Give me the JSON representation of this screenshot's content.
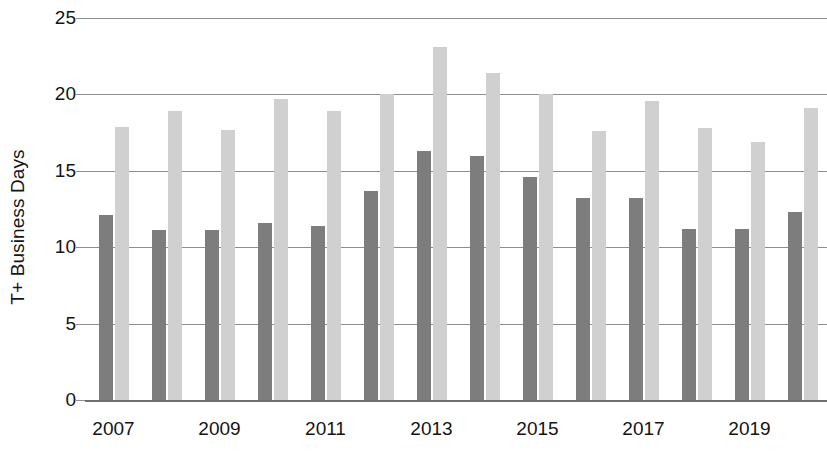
{
  "chart_data": {
    "type": "bar",
    "title": "",
    "xlabel": "",
    "ylabel": "T+ Business Days",
    "ylim": [
      0,
      25
    ],
    "yticks": [
      0,
      5,
      10,
      15,
      20,
      25
    ],
    "ytick_labels": [
      "0",
      "5",
      "10",
      "15",
      "20",
      "25"
    ],
    "grid": true,
    "legend": "none",
    "categories": [
      "2007",
      "2008",
      "2009",
      "2010",
      "2011",
      "2012",
      "2013",
      "2014",
      "2015",
      "2016",
      "2017",
      "2018",
      "2019",
      "2020"
    ],
    "xtick_labels": [
      "2007",
      "2009",
      "2011",
      "2013",
      "2015",
      "2017",
      "2019"
    ],
    "xtick_categories": [
      "2007",
      "2009",
      "2011",
      "2013",
      "2015",
      "2017",
      "2019"
    ],
    "series": [
      {
        "name": "dark-series",
        "color": "#7d7d7d",
        "values": [
          12.1,
          11.1,
          11.1,
          11.6,
          11.4,
          13.7,
          16.3,
          16.0,
          14.6,
          13.2,
          13.2,
          11.2,
          11.2,
          12.3
        ]
      },
      {
        "name": "light-series",
        "color": "#d0d0d0",
        "values": [
          17.9,
          18.9,
          17.7,
          19.7,
          18.9,
          20.0,
          23.1,
          21.4,
          20.0,
          17.6,
          19.6,
          17.8,
          16.9,
          19.1
        ]
      }
    ]
  },
  "axes": {
    "y_axis_title": "T+ Business Days"
  },
  "colors": {
    "gridline": "#8e8e8e",
    "baseline": "#6e6e6e",
    "text": "#141414",
    "background": "#ffffff"
  }
}
